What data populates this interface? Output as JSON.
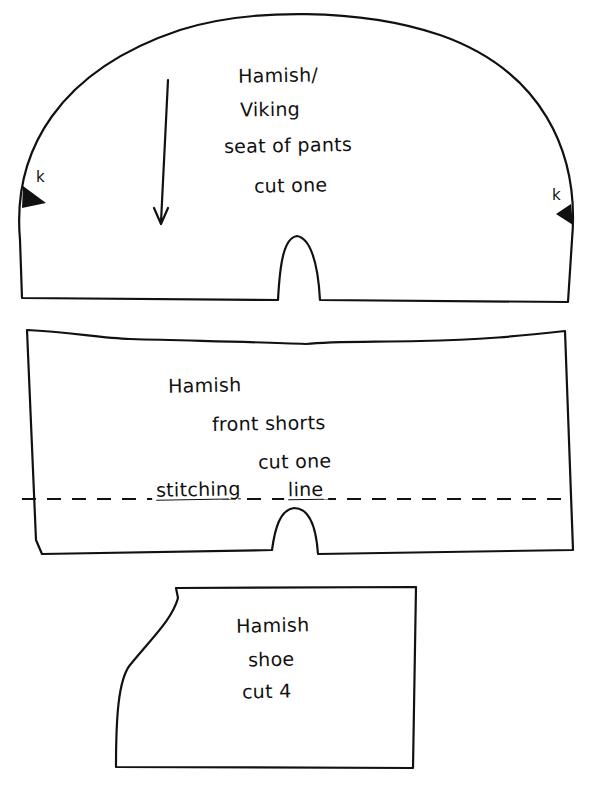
{
  "document": {
    "type": "sewing pattern sheet",
    "background": "#ffffff",
    "ink": "#111111"
  },
  "pieces": [
    {
      "id": "seat",
      "lines": [
        "Hamish/",
        "Viking",
        "seat of pants",
        "cut one"
      ],
      "notch_mark": "k",
      "grain_arrow": "down"
    },
    {
      "id": "front_shorts",
      "lines": [
        "Hamish",
        "front shorts",
        "cut one"
      ],
      "stitching_line_label": [
        "stitching",
        "line"
      ]
    },
    {
      "id": "shoe",
      "lines": [
        "Hamish",
        "shoe",
        "cut 4"
      ]
    }
  ]
}
